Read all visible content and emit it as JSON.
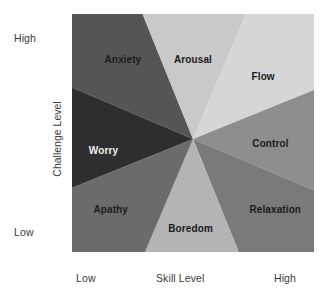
{
  "axes": {
    "y_title": "Challenge Level",
    "y_high": "High",
    "y_low": "Low",
    "x_title": "Skill Level",
    "x_low": "Low",
    "x_high": "High"
  },
  "chart_data": {
    "type": "pie",
    "title": "",
    "subtitle": "",
    "xlabel": "Skill Level",
    "ylabel": "Challenge Level",
    "xlim": [
      0,
      100
    ],
    "ylim": [
      0,
      100
    ],
    "grid": false,
    "legend": "none",
    "xtick_labels": [
      "Low",
      "High"
    ],
    "ytick_labels": [
      "Low",
      "High"
    ],
    "center": {
      "x": 50,
      "y": 52.5
    },
    "categories": [
      "Anxiety",
      "Arousal",
      "Flow",
      "Control",
      "Relaxation",
      "Boredom",
      "Apathy",
      "Worry"
    ],
    "values": [
      45,
      45,
      45,
      45,
      45,
      45,
      45,
      45
    ],
    "series": [
      {
        "name": "Flow model states",
        "values": [
          45,
          45,
          45,
          45,
          45,
          45,
          45,
          45
        ]
      }
    ],
    "slices": [
      {
        "label": "Anxiety",
        "color": "#555558",
        "label_color": "#1b1b1b",
        "start_angle_deg": 112,
        "end_angle_deg": 157,
        "label_x": 21,
        "label_y": 19
      },
      {
        "label": "Arousal",
        "color": "#c9c9c9",
        "label_color": "#1b1b1b",
        "start_angle_deg": 67,
        "end_angle_deg": 112,
        "label_x": 50,
        "label_y": 19
      },
      {
        "label": "Flow",
        "color": "#d6d6d6",
        "label_color": "#1b1b1b",
        "start_angle_deg": 22,
        "end_angle_deg": 67,
        "label_x": 79,
        "label_y": 26
      },
      {
        "label": "Control",
        "color": "#8e8e90",
        "label_color": "#1b1b1b",
        "start_angle_deg": -23,
        "end_angle_deg": 22,
        "label_x": 82,
        "label_y": 54
      },
      {
        "label": "Relaxation",
        "color": "#797a7c",
        "label_color": "#1b1b1b",
        "start_angle_deg": -68,
        "end_angle_deg": -23,
        "label_x": 84,
        "label_y": 82
      },
      {
        "label": "Boredom",
        "color": "#b4b4b4",
        "label_color": "#1b1b1b",
        "start_angle_deg": -113,
        "end_angle_deg": -68,
        "label_x": 49,
        "label_y": 90
      },
      {
        "label": "Apathy",
        "color": "#6b6b6e",
        "label_color": "#1b1b1b",
        "start_angle_deg": -158,
        "end_angle_deg": -113,
        "label_x": 16,
        "label_y": 82
      },
      {
        "label": "Worry",
        "color": "#2e2e31",
        "label_color": "#efefef",
        "start_angle_deg": 157,
        "end_angle_deg": 202,
        "label_x": 13,
        "label_y": 57
      }
    ],
    "colors": {
      "anxiety": "#555558",
      "arousal": "#c9c9c9",
      "flow": "#d6d6d6",
      "control": "#8e8e90",
      "relaxation": "#797a7c",
      "boredom": "#b4b4b4",
      "apathy": "#6b6b6e",
      "worry": "#2e2e31",
      "background": "#ffffff",
      "text": "#3a3a3a"
    }
  }
}
